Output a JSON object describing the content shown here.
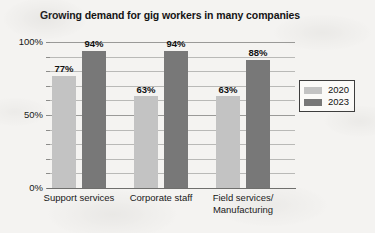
{
  "chart_data": {
    "type": "bar",
    "title": "Growing demand for gig workers in many companies",
    "xlabel": "",
    "ylabel": "",
    "categories": [
      "Support services",
      "Corporate staff",
      "Field services/ Manufacturing"
    ],
    "category_lines": [
      [
        "Support services"
      ],
      [
        "Corporate staff"
      ],
      [
        "Field services/",
        "Manufacturing"
      ]
    ],
    "series": [
      {
        "name": "2020",
        "color": "#c3c3c3",
        "values": [
          77,
          63,
          63
        ],
        "labels": [
          "77%",
          "63%",
          "63%"
        ]
      },
      {
        "name": "2023",
        "color": "#787878",
        "values": [
          94,
          94,
          88
        ],
        "labels": [
          "94%",
          "94%",
          "88%"
        ]
      }
    ],
    "ylim": [
      0,
      100
    ],
    "yticks": [
      0,
      10,
      20,
      30,
      40,
      50,
      60,
      70,
      80,
      90,
      100
    ],
    "ytick_labels_major": [
      "0%",
      "50%",
      "100%"
    ],
    "ytick_major_values": [
      0,
      50,
      100
    ],
    "grid": true,
    "legend_position": "right",
    "value_unit": "%"
  },
  "legend": {
    "entries": [
      {
        "label": "2020",
        "color": "#c3c3c3"
      },
      {
        "label": "2023",
        "color": "#787878"
      }
    ]
  }
}
